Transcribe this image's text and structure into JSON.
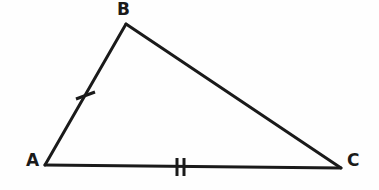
{
  "figure": {
    "kind": "geometry-diagram",
    "shape": "triangle",
    "background_color": "#fefefe",
    "stroke_color": "#1a1a1a",
    "stroke_width": 3,
    "width": 379,
    "height": 190
  },
  "vertices": [
    {
      "id": "A",
      "label": "A",
      "x": 45,
      "y": 165,
      "label_x": 26,
      "label_y": 152
    },
    {
      "id": "B",
      "label": "B",
      "x": 126,
      "y": 24,
      "label_x": 117,
      "label_y": 1
    },
    {
      "id": "C",
      "label": "C",
      "x": 341,
      "y": 168,
      "label_x": 347,
      "label_y": 152
    }
  ],
  "sides": [
    {
      "id": "AB",
      "from": "A",
      "to": "B",
      "x1": 45,
      "y1": 165,
      "x2": 126,
      "y2": 24,
      "tick_count": 1,
      "tick_marks": [
        {
          "x1": 76,
          "y1": 99,
          "x2": 95,
          "y2": 92
        }
      ]
    },
    {
      "id": "BC",
      "from": "B",
      "to": "C",
      "x1": 126,
      "y1": 24,
      "x2": 341,
      "y2": 168,
      "tick_count": 0,
      "tick_marks": []
    },
    {
      "id": "AC",
      "from": "A",
      "to": "C",
      "x1": 45,
      "y1": 165,
      "x2": 341,
      "y2": 168,
      "tick_count": 2,
      "tick_marks": [
        {
          "x1": 177,
          "y1": 158,
          "x2": 177,
          "y2": 176
        },
        {
          "x1": 184,
          "y1": 158,
          "x2": 184,
          "y2": 176
        }
      ]
    }
  ],
  "labels": {
    "a": "A",
    "b": "B",
    "c": "C"
  }
}
